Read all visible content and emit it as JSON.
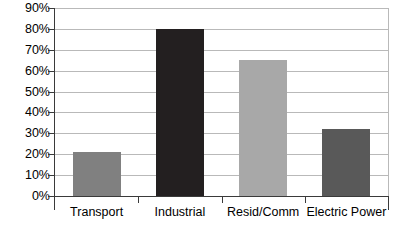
{
  "chart_data": {
    "type": "bar",
    "title": "",
    "subtitle": "",
    "xlabel": "",
    "ylabel": "",
    "categories": [
      "Transport",
      "Industrial",
      "Resid/Comm",
      "Electric Power"
    ],
    "values": [
      21,
      80,
      65,
      32
    ],
    "value_labels": [
      "21%",
      "80%",
      "65%",
      "32%"
    ],
    "series": [
      {
        "name": "Share",
        "values": [
          21,
          80,
          65,
          32
        ]
      }
    ],
    "bar_colors": [
      "#808080",
      "#231f20",
      "#a8a8a8",
      "#595959"
    ],
    "ylim": [
      0,
      90
    ],
    "ytick_values": [
      0,
      10,
      20,
      30,
      40,
      50,
      60,
      70,
      80,
      90
    ],
    "ytick_labels": [
      "0%",
      "10%",
      "20%",
      "30%",
      "40%",
      "50%",
      "60%",
      "70%",
      "80%",
      "90%"
    ],
    "grid": true,
    "grid_axis": "y",
    "legend": false,
    "legend_position": "none",
    "annotations": [],
    "axis_color": "#3a3a3a",
    "grid_color": "#b9b9b9",
    "background_color": "#ffffff"
  }
}
